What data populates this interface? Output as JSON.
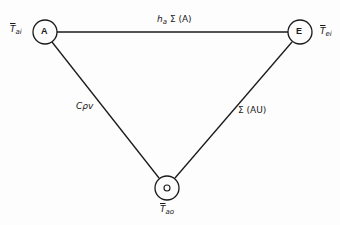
{
  "diagram": {
    "type": "thermal network triangle",
    "nodes": [
      {
        "id": "A",
        "label": "A",
        "x": 45,
        "y": 32,
        "r": 12
      },
      {
        "id": "E",
        "label": "E",
        "x": 300,
        "y": 32,
        "r": 12
      },
      {
        "id": "O",
        "label": "O",
        "x": 167,
        "y": 188,
        "r": 12
      }
    ],
    "edges": [
      {
        "from": "A",
        "to": "E",
        "label": "h_a Σ (A)",
        "label_main": "h",
        "label_sub": "a",
        "label_rest": " Σ (A)"
      },
      {
        "from": "A",
        "to": "O",
        "label": "Cρv"
      },
      {
        "from": "E",
        "to": "O",
        "label": "Σ (AU)"
      }
    ],
    "node_temperature_labels": {
      "A": {
        "main": "T",
        "sub": "ai"
      },
      "E": {
        "main": "T",
        "sub": "ei"
      },
      "O": {
        "main": "T",
        "sub": "ao"
      }
    },
    "colors": {
      "line": "#1a1a1a",
      "background": "#fdfdfd"
    }
  }
}
